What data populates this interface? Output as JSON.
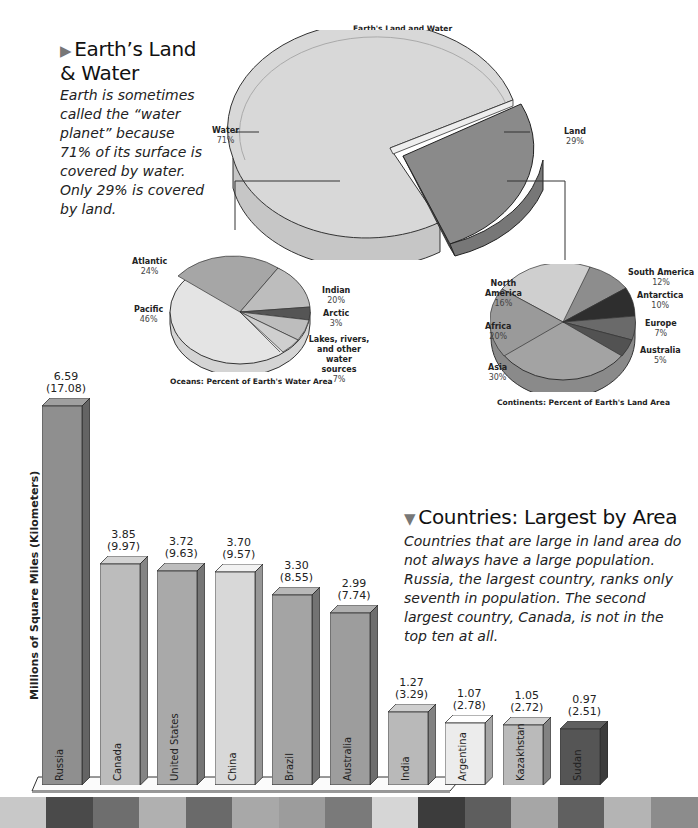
{
  "intro": {
    "title_line1": "Earth’s Land",
    "title_line2": "& Water",
    "marker": "▶",
    "text": "Earth is sometimes called the “water planet” because 71% of its surface is covered by water. Only 29% is covered by land."
  },
  "countries_section": {
    "marker": "▼",
    "title": "Countries: Largest by Area",
    "text": "Countries that are large in land area do not always have a large population. Russia, the largest country, ranks only seventh in population. The second largest country, Canada, is not in the top ten at all."
  },
  "chart_data": [
    {
      "type": "pie",
      "title": "Earth's Land and Water",
      "categories": [
        "Water",
        "Land"
      ],
      "values": [
        71,
        29
      ],
      "labels": [
        "71%",
        "29%"
      ],
      "colors": [
        "#d6d6d6",
        "#8a8a8a"
      ]
    },
    {
      "type": "pie",
      "title": "Oceans: Percent of Earth's Water Area",
      "categories": [
        "Pacific",
        "Atlantic",
        "Indian",
        "Arctic",
        "Lakes, rivers, and other water sources"
      ],
      "values": [
        46,
        24,
        20,
        3,
        7
      ],
      "labels": [
        "46%",
        "24%",
        "20%",
        "3%",
        "7%"
      ],
      "colors": [
        "#e4e4e4",
        "#a6a6a6",
        "#bdbdbd",
        "#555555",
        "#c9c9c9"
      ]
    },
    {
      "type": "pie",
      "title": "Continents: Percent of Earth's Land Area",
      "categories": [
        "Asia",
        "Africa",
        "North America",
        "South America",
        "Antarctica",
        "Europe",
        "Australia"
      ],
      "values": [
        30,
        20,
        16,
        12,
        10,
        7,
        5
      ],
      "labels": [
        "30%",
        "20%",
        "16%",
        "12%",
        "10%",
        "7%",
        "5%"
      ],
      "colors": [
        "#a3a3a3",
        "#9a9a9a",
        "#cfcfcf",
        "#8d8d8d",
        "#2e2e2e",
        "#6a6a6a",
        "#525252"
      ]
    },
    {
      "type": "bar",
      "title": "Countries: Largest by Area",
      "xlabel": "",
      "ylabel": "Millions of Square Miles (Kilometers)",
      "categories": [
        "Russia",
        "Canada",
        "United States",
        "China",
        "Brazil",
        "Australia",
        "India",
        "Argentina",
        "Kazakhstan",
        "Sudan"
      ],
      "series": [
        {
          "name": "Square miles (millions)",
          "values": [
            6.59,
            3.85,
            3.72,
            3.7,
            3.3,
            2.99,
            1.27,
            1.07,
            1.05,
            0.97
          ]
        },
        {
          "name": "Square kilometers (millions)",
          "values": [
            17.08,
            9.97,
            9.63,
            9.57,
            8.55,
            7.74,
            3.29,
            2.78,
            2.72,
            2.51
          ]
        }
      ],
      "value_labels": [
        "6.59",
        "3.85",
        "3.72",
        "3.70",
        "3.30",
        "2.99",
        "1.27",
        "1.07",
        "1.05",
        "0.97"
      ],
      "km_labels": [
        "(17.08)",
        "(9.97)",
        "(9.63)",
        "(9.57)",
        "(8.55)",
        "(7.74)",
        "(3.29)",
        "(2.78)",
        "(2.72)",
        "(2.51)"
      ],
      "colors": [
        "#8f8f8f",
        "#bcbcbc",
        "#a9a9a9",
        "#d8d8d8",
        "#a4a4a4",
        "#9d9d9d",
        "#b9b9b9",
        "#ececec",
        "#bababa",
        "#555555"
      ],
      "grid": false,
      "legend": "none"
    }
  ],
  "labels": {
    "main_pie": {
      "water": "Water",
      "water_pct": "71%",
      "land": "Land",
      "land_pct": "29%"
    },
    "oceans": {
      "atlantic": "Atlantic",
      "atlantic_pct": "24%",
      "pacific": "Pacific",
      "pacific_pct": "46%",
      "indian": "Indian",
      "indian_pct": "20%",
      "arctic": "Arctic",
      "arctic_pct": "3%",
      "lakes_l1": "Lakes, rivers,",
      "lakes_l2": "and other water",
      "lakes_l3": "sources",
      "lakes_pct": "7%"
    },
    "continents": {
      "north_america_l1": "North",
      "north_america_l2": "America",
      "north_america_pct": "16%",
      "africa": "Africa",
      "africa_pct": "20%",
      "asia": "Asia",
      "asia_pct": "30%",
      "south_america": "South America",
      "south_america_pct": "12%",
      "antarctica": "Antarctica",
      "antarctica_pct": "10%",
      "europe": "Europe",
      "europe_pct": "7%",
      "australia": "Australia",
      "australia_pct": "5%"
    }
  },
  "footer_stripe": {
    "colors": [
      "#c8c8c8",
      "#4a4a4a",
      "#6e6e6e",
      "#b0b0b0",
      "#6a6a6a",
      "#a8a8a8",
      "#9c9c9c",
      "#7a7a7a",
      "#d6d6d6",
      "#3c3c3c",
      "#5e5e5e",
      "#a6a6a6",
      "#606060",
      "#b4b4b4",
      "#8c8c8c"
    ]
  }
}
